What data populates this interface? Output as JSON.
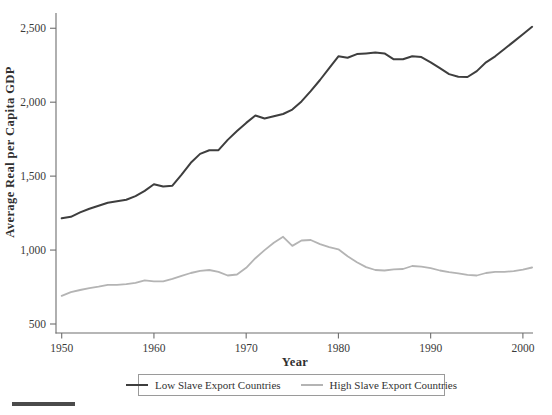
{
  "chart_data": {
    "type": "line",
    "title": "",
    "xlabel": "Year",
    "ylabel": "Average Real per Capita GDP",
    "xlim": [
      1949,
      2002
    ],
    "ylim": [
      450,
      2600
    ],
    "grid": false,
    "legend_position": "bottom",
    "x_ticks": [
      1950,
      1960,
      1970,
      1980,
      1990,
      2000
    ],
    "y_ticks": [
      500,
      1000,
      1500,
      2000,
      2500
    ],
    "y_tick_labels": [
      "500",
      "1,000",
      "1,500",
      "2,000",
      "2,500"
    ],
    "x": [
      1950,
      1951,
      1952,
      1953,
      1954,
      1955,
      1956,
      1957,
      1958,
      1959,
      1960,
      1961,
      1962,
      1963,
      1964,
      1965,
      1966,
      1967,
      1968,
      1969,
      1970,
      1971,
      1972,
      1973,
      1974,
      1975,
      1976,
      1977,
      1978,
      1979,
      1980,
      1981,
      1982,
      1983,
      1984,
      1985,
      1986,
      1987,
      1988,
      1989,
      1990,
      1991,
      1992,
      1993,
      1994,
      1995,
      1996,
      1997,
      1998,
      1999,
      2000,
      2001
    ],
    "series": [
      {
        "name": "Low Slave Export Countries",
        "color": "#3e3e3e",
        "values": [
          1215,
          1225,
          1255,
          1280,
          1300,
          1320,
          1330,
          1340,
          1365,
          1400,
          1445,
          1430,
          1435,
          1510,
          1590,
          1650,
          1675,
          1675,
          1745,
          1805,
          1860,
          1910,
          1890,
          1905,
          1920,
          1950,
          2005,
          2075,
          2150,
          2230,
          2310,
          2300,
          2325,
          2330,
          2335,
          2330,
          2290,
          2290,
          2310,
          2305,
          2270,
          2230,
          2190,
          2172,
          2170,
          2210,
          2270,
          2310,
          2360,
          2410,
          2460,
          2510
        ]
      },
      {
        "name": "High Slave Export Countries",
        "color": "#b4b4b4",
        "values": [
          690,
          715,
          730,
          742,
          752,
          765,
          765,
          770,
          778,
          795,
          788,
          788,
          805,
          825,
          845,
          860,
          865,
          852,
          828,
          835,
          880,
          945,
          1000,
          1050,
          1090,
          1028,
          1065,
          1068,
          1040,
          1020,
          1005,
          958,
          918,
          885,
          865,
          862,
          870,
          872,
          892,
          888,
          878,
          862,
          850,
          843,
          832,
          828,
          845,
          852,
          853,
          857,
          868,
          882
        ]
      }
    ]
  }
}
